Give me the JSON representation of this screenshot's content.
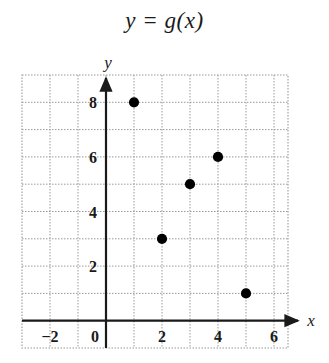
{
  "chart_data": {
    "type": "scatter",
    "title": "y = g(x)",
    "xlabel": "x",
    "ylabel": "y",
    "xlim": [
      -3,
      6.5
    ],
    "ylim": [
      -1,
      9
    ],
    "grid": true,
    "grid_step": 1,
    "legend": "none",
    "points": [
      {
        "x": 1,
        "y": 8
      },
      {
        "x": 2,
        "y": 3
      },
      {
        "x": 3,
        "y": 5
      },
      {
        "x": 4,
        "y": 6
      },
      {
        "x": 5,
        "y": 1
      }
    ],
    "x_ticks": [
      {
        "value": -2,
        "label": "−2"
      },
      {
        "value": 0,
        "label": "0"
      },
      {
        "value": 2,
        "label": "2"
      },
      {
        "value": 4,
        "label": "4"
      },
      {
        "value": 6,
        "label": "6"
      }
    ],
    "y_ticks": [
      {
        "value": 2,
        "label": "2"
      },
      {
        "value": 4,
        "label": "4"
      },
      {
        "value": 6,
        "label": "6"
      },
      {
        "value": 8,
        "label": "8"
      }
    ],
    "colors": {
      "grid": "#9a9a9a",
      "axis": "#1a1a1a",
      "marker": "#000000",
      "background": "#ffffff",
      "text": "#1a1a1a"
    }
  }
}
